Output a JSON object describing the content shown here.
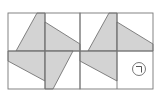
{
  "figure": {
    "colors": {
      "background": "#ffffff",
      "grid_line": "#777777",
      "shape_fill": "#d3d3d3",
      "shape_stroke": "#666666",
      "marker_stroke": "#555555"
    },
    "panels": [
      {
        "name": "complete-pinwheel",
        "pieces": [
          "top-left",
          "top-right",
          "bottom-left",
          "bottom-right"
        ]
      },
      {
        "name": "incomplete-pinwheel",
        "pieces": [
          "top-left",
          "top-right",
          "bottom-left"
        ],
        "missing_cell": "bottom-right",
        "marker_symbol": "ㄱ"
      }
    ]
  }
}
